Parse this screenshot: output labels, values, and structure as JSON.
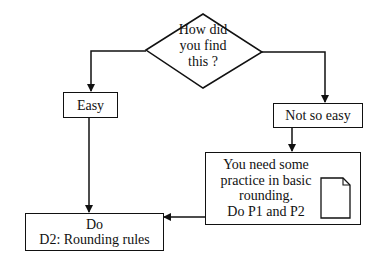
{
  "diagram": {
    "type": "flowchart",
    "decision": {
      "lines": [
        "How did",
        "you find",
        "this ?"
      ]
    },
    "options": {
      "easy": "Easy",
      "not_so_easy": "Not so easy"
    },
    "practice_box": {
      "lines": [
        "You need some",
        "practice in basic",
        "rounding.",
        "Do P1 and P2"
      ],
      "icon": "document-icon"
    },
    "result_box": {
      "lines": [
        "Do",
        "D2: Rounding rules"
      ]
    },
    "colors": {
      "line": "#111111",
      "background": "#ffffff"
    }
  }
}
